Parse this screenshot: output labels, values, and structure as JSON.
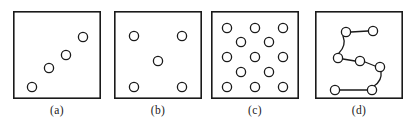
{
  "figure": {
    "title": "",
    "background_color": "#ffffff",
    "stroke_color": "#1a1a1a",
    "fill_color": "#ffffff",
    "panel_border_width": 1.6,
    "circle_stroke_width": 1.3,
    "link_stroke_width": 1.3,
    "circle_radius": 4.6,
    "panel_geometry": {
      "top": 11,
      "height": 88,
      "width": 88
    },
    "caption_top": 104
  },
  "panels": [
    {
      "id": "a",
      "caption": "(a)",
      "pattern_name": "clustered-diagonal-pattern",
      "x": 13,
      "count": 4,
      "circles": [
        {
          "cx": 19,
          "cy": 76
        },
        {
          "cx": 36,
          "cy": 57
        },
        {
          "cx": 53,
          "cy": 44
        },
        {
          "cx": 70,
          "cy": 26
        }
      ],
      "links": []
    },
    {
      "id": "b",
      "caption": "(b)",
      "pattern_name": "quincunx-regular-pattern",
      "x": 114,
      "count": 5,
      "circles": [
        {
          "cx": 20,
          "cy": 25
        },
        {
          "cx": 68,
          "cy": 25
        },
        {
          "cx": 44,
          "cy": 50
        },
        {
          "cx": 20,
          "cy": 76
        },
        {
          "cx": 68,
          "cy": 76
        }
      ],
      "links": []
    },
    {
      "id": "c",
      "caption": "(c)",
      "pattern_name": "dense-staggered-grid-pattern",
      "x": 211,
      "count": 13,
      "circles": [
        {
          "cx": 16,
          "cy": 17
        },
        {
          "cx": 44,
          "cy": 17
        },
        {
          "cx": 72,
          "cy": 17
        },
        {
          "cx": 30,
          "cy": 31
        },
        {
          "cx": 58,
          "cy": 31
        },
        {
          "cx": 16,
          "cy": 46
        },
        {
          "cx": 44,
          "cy": 46
        },
        {
          "cx": 72,
          "cy": 46
        },
        {
          "cx": 30,
          "cy": 61
        },
        {
          "cx": 58,
          "cy": 61
        },
        {
          "cx": 16,
          "cy": 76
        },
        {
          "cx": 44,
          "cy": 76
        },
        {
          "cx": 72,
          "cy": 76
        }
      ],
      "links": []
    },
    {
      "id": "d",
      "caption": "(d)",
      "pattern_name": "connected-chain-pattern",
      "x": 315,
      "count": 7,
      "circles": [
        {
          "cx": 31,
          "cy": 21
        },
        {
          "cx": 58,
          "cy": 20
        },
        {
          "cx": 23,
          "cy": 47
        },
        {
          "cx": 45,
          "cy": 50
        },
        {
          "cx": 65,
          "cy": 56
        },
        {
          "cx": 57,
          "cy": 79
        },
        {
          "cx": 20,
          "cy": 79
        }
      ],
      "links": [
        {
          "from": 0,
          "to": 1
        },
        {
          "from": 0,
          "to": 2
        },
        {
          "from": 2,
          "to": 3
        },
        {
          "from": 3,
          "to": 4
        },
        {
          "from": 4,
          "to": 5
        },
        {
          "from": 5,
          "to": 6
        }
      ]
    }
  ]
}
